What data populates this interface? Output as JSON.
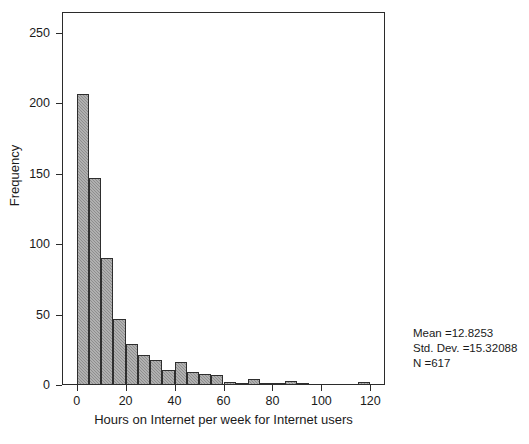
{
  "chart_data": {
    "type": "bar",
    "chart_subtype": "histogram",
    "title": "",
    "xlabel": "Hours on Internet per week for Internet users",
    "ylabel": "Frequency",
    "xlim": [
      -6,
      126
    ],
    "ylim": [
      0,
      265
    ],
    "xticks": [
      0,
      20,
      40,
      60,
      80,
      100,
      120
    ],
    "xtick_labels": [
      "0",
      "20",
      "40",
      "60",
      "80",
      "100",
      "120"
    ],
    "yticks": [
      0,
      50,
      100,
      150,
      200,
      250
    ],
    "ytick_labels": [
      "0",
      "50",
      "100",
      "150",
      "200",
      "250"
    ],
    "grid": false,
    "legend": false,
    "bin_width": 5,
    "bin_starts": [
      0,
      5,
      10,
      15,
      20,
      25,
      30,
      35,
      40,
      45,
      50,
      55,
      60,
      65,
      70,
      75,
      80,
      85,
      90,
      95,
      100,
      105,
      110,
      115
    ],
    "categories": [
      "0-5",
      "5-10",
      "10-15",
      "15-20",
      "20-25",
      "25-30",
      "30-35",
      "35-40",
      "40-45",
      "45-50",
      "50-55",
      "55-60",
      "60-65",
      "65-70",
      "70-75",
      "75-80",
      "80-85",
      "85-90",
      "90-95",
      "95-100",
      "100-105",
      "105-110",
      "110-115",
      "115-120"
    ],
    "values": [
      207,
      147,
      90,
      47,
      29,
      21,
      18,
      11,
      16,
      9,
      8,
      7,
      2,
      1,
      4,
      1,
      1,
      3,
      1,
      0,
      0,
      0,
      0,
      2
    ],
    "bar_color": "#8e8e8e",
    "bar_edge_color": "#2e2e2e",
    "annotations": {
      "mean_label": "Mean =12.8253",
      "std_label": "Std. Dev. =15.32088",
      "n_label": "N =617",
      "mean_value": 12.8253,
      "std_dev_value": 15.32088,
      "n_value": 617
    }
  }
}
